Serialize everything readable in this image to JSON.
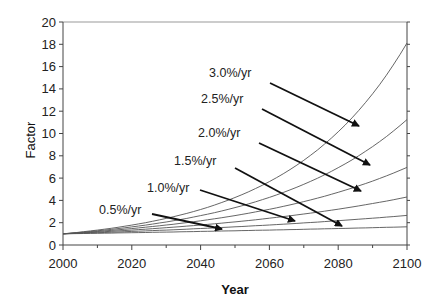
{
  "chart_data": {
    "type": "line",
    "title": "",
    "xlabel": "Year",
    "ylabel": "Factor",
    "xlim": [
      2000,
      2100
    ],
    "ylim": [
      0,
      20
    ],
    "xticks": [
      2000,
      2020,
      2040,
      2060,
      2080,
      2100
    ],
    "yticks": [
      0,
      2,
      4,
      6,
      8,
      10,
      12,
      14,
      16,
      18,
      20
    ],
    "grid": false,
    "legend": "none (inline arrow annotations)",
    "x": [
      2000,
      2010,
      2020,
      2030,
      2040,
      2050,
      2060,
      2070,
      2080,
      2090,
      2100
    ],
    "series": [
      {
        "name": "0.5%/yr",
        "rate": 0.005,
        "values": [
          1.0,
          1.05,
          1.1,
          1.16,
          1.22,
          1.28,
          1.35,
          1.41,
          1.49,
          1.56,
          1.63
        ]
      },
      {
        "name": "1.0%/yr",
        "rate": 0.01,
        "values": [
          1.0,
          1.1,
          1.22,
          1.35,
          1.49,
          1.64,
          1.82,
          2.01,
          2.22,
          2.45,
          2.65
        ]
      },
      {
        "name": "1.5%/yr",
        "rate": 0.015,
        "values": [
          1.0,
          1.16,
          1.35,
          1.56,
          1.81,
          2.11,
          2.44,
          2.84,
          3.29,
          3.82,
          4.3
        ]
      },
      {
        "name": "2.0%/yr",
        "rate": 0.02,
        "values": [
          1.0,
          1.22,
          1.49,
          1.81,
          2.21,
          2.69,
          3.28,
          4.0,
          4.88,
          5.94,
          7.0
        ]
      },
      {
        "name": "2.5%/yr",
        "rate": 0.025,
        "values": [
          1.0,
          1.28,
          1.64,
          2.1,
          2.69,
          3.44,
          4.4,
          5.63,
          7.21,
          9.23,
          11.4
        ]
      },
      {
        "name": "3.0%/yr",
        "rate": 0.03,
        "values": [
          1.0,
          1.34,
          1.81,
          2.43,
          3.26,
          4.38,
          5.89,
          7.92,
          10.64,
          14.3,
          18.2
        ]
      }
    ],
    "annotations": [
      {
        "text": "3.0%/yr",
        "target_series": "3.0%/yr"
      },
      {
        "text": "2.5%/yr",
        "target_series": "2.5%/yr"
      },
      {
        "text": "2.0%/yr",
        "target_series": "2.0%/yr"
      },
      {
        "text": "1.5%/yr",
        "target_series": "1.5%/yr"
      },
      {
        "text": "1.0%/yr",
        "target_series": "1.0%/yr"
      },
      {
        "text": "0.5%/yr",
        "target_series": "0.5%/yr"
      }
    ]
  },
  "colors": {
    "line": "#555555",
    "arrow": "#111111",
    "axis": "#444444",
    "frame": "#999999"
  }
}
